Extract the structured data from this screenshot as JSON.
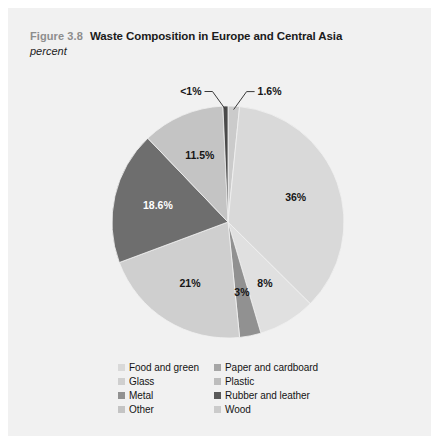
{
  "header": {
    "figure_number": "Figure 3.8",
    "title": "Waste Composition in Europe and Central Asia",
    "subtitle": "percent"
  },
  "legend": {
    "items": [
      {
        "label": "Food and green",
        "color": "#d9d9d9",
        "column": "left"
      },
      {
        "label": "Paper and cardboard",
        "color": "#a6a6a6",
        "column": "right"
      },
      {
        "label": "Glass",
        "color": "#cfcfcf",
        "column": "left"
      },
      {
        "label": "Plastic",
        "color": "#bdbdbd",
        "column": "right"
      },
      {
        "label": "Metal",
        "color": "#919191",
        "column": "left"
      },
      {
        "label": "Rubber and leather",
        "color": "#5a5a5a",
        "column": "right"
      },
      {
        "label": "Other",
        "color": "#c4c4c4",
        "column": "left"
      },
      {
        "label": "Wood",
        "color": "#cbcbcb",
        "column": "right"
      }
    ]
  },
  "chart_data": {
    "type": "pie",
    "title": "Waste Composition in Europe and Central Asia",
    "subtitle": "percent",
    "units": "percent",
    "legend_position": "bottom",
    "grid": false,
    "start_angle_deg": 0,
    "direction": "clockwise",
    "categories": [
      "Wood",
      "Food and green",
      "Paper and cardboard",
      "Metal",
      "Glass",
      "Plastic",
      "Other",
      "Rubber and leather"
    ],
    "values": [
      1.6,
      36,
      8,
      3,
      21,
      18.6,
      11.5,
      0.7
    ],
    "slices": [
      {
        "label": "1.6%",
        "value": 1.6,
        "category": "Wood",
        "color": "#cbcbcb",
        "label_style": "callout",
        "label_side": "right"
      },
      {
        "label": "36%",
        "value": 36,
        "category": "Food and green",
        "color": "#d9d9d9",
        "label_style": "inside",
        "label_side": ""
      },
      {
        "label": "8%",
        "value": 8,
        "category": "Paper and cardboard",
        "color": "#e0e0e0",
        "label_style": "inside",
        "label_side": ""
      },
      {
        "label": "3%",
        "value": 3,
        "category": "Metal",
        "color": "#919191",
        "label_style": "inside",
        "label_side": ""
      },
      {
        "label": "21%",
        "value": 21,
        "category": "Glass",
        "color": "#cfcfcf",
        "label_style": "inside",
        "label_side": ""
      },
      {
        "label": "18.6%",
        "value": 18.6,
        "category": "Plastic",
        "color": "#6e6e6e",
        "label_style": "inside",
        "label_side": ""
      },
      {
        "label": "11.5%",
        "value": 11.5,
        "category": "Other",
        "color": "#c4c4c4",
        "label_style": "inside",
        "label_side": ""
      },
      {
        "label": "<1%",
        "value": 0.7,
        "category": "Rubber and leather",
        "color": "#4a4a4a",
        "label_style": "callout",
        "label_side": "left"
      }
    ]
  },
  "colors": {
    "page_background": "#f1f1f1",
    "outer_background": "#ffffff",
    "figure_number": "#8d8d8d",
    "text": "#1b1b1b",
    "leader_line": "#3a3a3a"
  }
}
